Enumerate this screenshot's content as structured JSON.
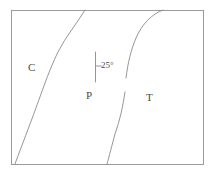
{
  "figure": {
    "title": "",
    "background_color": "#ffffff",
    "line_color": "#8a8a8a",
    "border_color": "#9a9a9a",
    "text_color": "#4a4a4a",
    "frame": {
      "x": 11,
      "y": 10,
      "width": 193,
      "height": 155
    },
    "regions": [
      {
        "id": "c",
        "label": "C",
        "x": 28,
        "y": 62
      },
      {
        "id": "p",
        "label": "P",
        "x": 86,
        "y": 90
      },
      {
        "id": "t",
        "label": "T",
        "x": 146,
        "y": 92
      }
    ],
    "annotation": {
      "label": "25°",
      "x": 101,
      "y": 61,
      "tick_x": 95,
      "tick_top": 52,
      "tick_bottom": 82,
      "crossbar_y": 66,
      "crossbar_width": 6
    },
    "boundaries": [
      {
        "id": "left-boundary",
        "name": "c-p-boundary",
        "path": "M 85,10 C 78,22 66,36 58,52 C 48,72 40,98 30,124 C 24,140 19,153 15,164"
      },
      {
        "id": "right-boundary-upper",
        "name": "p-t-boundary-upper",
        "path": "M 163,10 C 152,14 142,24 136,38 C 131,50 128,62 126,78"
      },
      {
        "id": "right-boundary-lower",
        "name": "p-t-boundary-lower",
        "path": "M 125,92 C 123,106 120,120 115,134 C 112,145 109,157 107,164"
      }
    ]
  }
}
